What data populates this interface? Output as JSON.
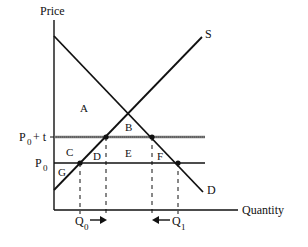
{
  "diagram": {
    "type": "supply-demand-tariff",
    "axes": {
      "y_label": "Price",
      "x_label": "Quantity"
    },
    "curves": {
      "supply_label": "S",
      "demand_label": "D"
    },
    "price_levels": {
      "upper": {
        "base": "P",
        "sub": "0",
        "suffix": "+ t"
      },
      "lower": {
        "base": "P",
        "sub": "0"
      }
    },
    "quantities": {
      "q0": {
        "base": "Q",
        "sub": "0",
        "arrow": "right"
      },
      "q1": {
        "base": "Q",
        "sub": "1",
        "arrow": "left"
      }
    },
    "regions": [
      "A",
      "B",
      "C",
      "D",
      "E",
      "F",
      "G"
    ],
    "colors": {
      "ink": "#111111",
      "tariff_line": "#777777",
      "background": "#ffffff"
    }
  }
}
